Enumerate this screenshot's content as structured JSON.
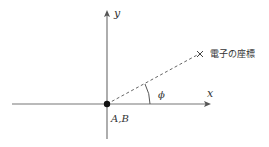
{
  "diagram": {
    "axes": {
      "x_label": "x",
      "y_label": "y"
    },
    "origin_label": "A,B",
    "point_label": "電子の座標",
    "angle_label": "ϕ",
    "colors": {
      "axis": "#777777",
      "dashed_line": "#666666",
      "text": "#333333",
      "origin_dot": "#111111"
    }
  }
}
